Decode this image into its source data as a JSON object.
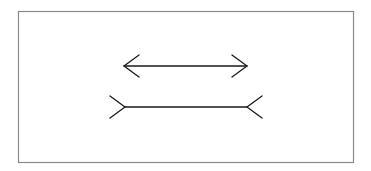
{
  "figure": {
    "name": "Müller-Lyer illusion",
    "frame": {
      "x": 18,
      "y": 11,
      "width": 335,
      "height": 151,
      "stroke": "#8a8a8a"
    },
    "line_color": "#1a1a1a",
    "top_arrow": {
      "description": "Line with outward-pointing arrowheads",
      "x1": 124,
      "x2": 247,
      "y": 66,
      "head_dx": 15,
      "head_dy": 11
    },
    "bottom_arrow": {
      "description": "Line with inward-pointing (fin) ends",
      "x1": 125,
      "x2": 247,
      "y": 107,
      "fin_dx": 15,
      "fin_dy": 11
    }
  }
}
